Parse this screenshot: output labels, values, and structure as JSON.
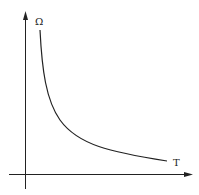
{
  "diagram": {
    "y_axis_label": "Ω",
    "x_axis_label": "T",
    "curve_description": "Decreasing hyperbolic curve: Ω inversely proportional to T",
    "line_color": "#222222"
  }
}
